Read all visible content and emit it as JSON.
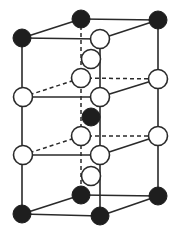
{
  "diagram": {
    "title": "",
    "type": "hexagonal crystal structure unit cell (perspective)",
    "colors": {
      "background": "#ffffff",
      "line": "#2a2a2a",
      "dark_atom": "#1e1e1e",
      "light_atom": "#ffffff"
    },
    "atom_radius": {
      "dark": 9,
      "light": 9.5
    },
    "atoms": [
      {
        "id": "top-front-left",
        "x": 22,
        "y": 38,
        "kind": "dark"
      },
      {
        "id": "top-back-mid",
        "x": 81,
        "y": 19,
        "kind": "dark"
      },
      {
        "id": "top-back-right",
        "x": 158,
        "y": 20,
        "kind": "dark"
      },
      {
        "id": "top-front-mid",
        "x": 100,
        "y": 39,
        "kind": "light"
      },
      {
        "id": "interior-upper",
        "x": 91,
        "y": 59,
        "kind": "light"
      },
      {
        "id": "upper-left",
        "x": 23,
        "y": 97,
        "kind": "light"
      },
      {
        "id": "upper-back-mid",
        "x": 81,
        "y": 78,
        "kind": "light"
      },
      {
        "id": "upper-back-right",
        "x": 158,
        "y": 79,
        "kind": "light"
      },
      {
        "id": "upper-front-mid",
        "x": 100,
        "y": 97,
        "kind": "light"
      },
      {
        "id": "center",
        "x": 91,
        "y": 117,
        "kind": "dark"
      },
      {
        "id": "lower-left",
        "x": 23,
        "y": 155,
        "kind": "light"
      },
      {
        "id": "lower-back-mid",
        "x": 81,
        "y": 136,
        "kind": "light"
      },
      {
        "id": "lower-back-right",
        "x": 158,
        "y": 136,
        "kind": "light"
      },
      {
        "id": "lower-front-mid",
        "x": 100,
        "y": 155,
        "kind": "light"
      },
      {
        "id": "interior-lower",
        "x": 91,
        "y": 176,
        "kind": "light"
      },
      {
        "id": "bottom-back-mid",
        "x": 81,
        "y": 195,
        "kind": "dark"
      },
      {
        "id": "bottom-back-right",
        "x": 158,
        "y": 196,
        "kind": "dark"
      },
      {
        "id": "bottom-front-left",
        "x": 22,
        "y": 214,
        "kind": "dark"
      },
      {
        "id": "bottom-front-mid",
        "x": 100,
        "y": 216,
        "kind": "dark"
      }
    ],
    "edges": [
      {
        "from": "top-front-left",
        "to": "top-back-mid",
        "style": "solid"
      },
      {
        "from": "top-back-mid",
        "to": "top-back-right",
        "style": "solid"
      },
      {
        "from": "top-front-left",
        "to": "top-front-mid",
        "style": "solid"
      },
      {
        "from": "top-front-mid",
        "to": "top-back-right",
        "style": "solid"
      },
      {
        "from": "top-front-left",
        "to": "bottom-front-left",
        "style": "solid"
      },
      {
        "from": "top-back-right",
        "to": "bottom-back-right",
        "style": "solid"
      },
      {
        "from": "top-front-mid",
        "to": "bottom-front-mid",
        "style": "solid"
      },
      {
        "from": "top-back-mid",
        "to": "bottom-back-mid",
        "style": "dashed"
      },
      {
        "from": "upper-left",
        "to": "upper-front-mid",
        "style": "solid"
      },
      {
        "from": "upper-front-mid",
        "to": "upper-back-right",
        "style": "solid"
      },
      {
        "from": "upper-left",
        "to": "upper-back-mid",
        "style": "dashed"
      },
      {
        "from": "upper-back-mid",
        "to": "upper-back-right",
        "style": "dashed"
      },
      {
        "from": "lower-left",
        "to": "lower-front-mid",
        "style": "solid"
      },
      {
        "from": "lower-front-mid",
        "to": "lower-back-right",
        "style": "solid"
      },
      {
        "from": "lower-left",
        "to": "lower-back-mid",
        "style": "dashed"
      },
      {
        "from": "lower-back-mid",
        "to": "lower-back-right",
        "style": "dashed"
      },
      {
        "from": "bottom-front-left",
        "to": "bottom-back-mid",
        "style": "solid"
      },
      {
        "from": "bottom-back-mid",
        "to": "bottom-back-right",
        "style": "solid"
      },
      {
        "from": "bottom-front-left",
        "to": "bottom-front-mid",
        "style": "solid"
      },
      {
        "from": "bottom-front-mid",
        "to": "bottom-back-right",
        "style": "solid"
      }
    ]
  }
}
